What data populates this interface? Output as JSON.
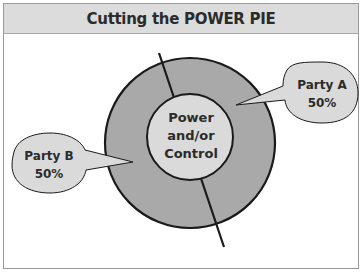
{
  "title": "Cutting the POWER PIE",
  "center": {
    "line1": "Power",
    "line2": "and/or",
    "line3": "Control"
  },
  "callouts": [
    {
      "name": "Party A",
      "share": "50%"
    },
    {
      "name": "Party B",
      "share": "50%"
    }
  ],
  "colors": {
    "title_band": "#dcdcdc",
    "ring": "#a9a9a9",
    "center": "#dadada",
    "callout": "#dadada",
    "stroke": "#1a1a1a"
  }
}
